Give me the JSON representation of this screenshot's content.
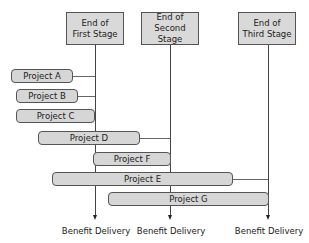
{
  "stages": [
    {
      "label_line1": "End of",
      "label_line2": "First Stage"
    },
    {
      "label_line1": "End of",
      "label_line2": "Second Stage"
    },
    {
      "label_line1": "End of",
      "label_line2": "Third Stage"
    }
  ],
  "projects": [
    {
      "label": "Project A"
    },
    {
      "label": "Project B"
    },
    {
      "label": "Project C"
    },
    {
      "label": "Project D"
    },
    {
      "label": "Project F"
    },
    {
      "label": "Project E"
    },
    {
      "label": "Project G"
    }
  ],
  "outcomes": [
    {
      "label": "Benefit Delivery"
    },
    {
      "label": "Benefit Delivery"
    },
    {
      "label": "Benefit Delivery"
    }
  ],
  "colors": {
    "box_fill": "#d9d9d9",
    "bar_fill": "#d6d6d6",
    "line": "#444444"
  }
}
